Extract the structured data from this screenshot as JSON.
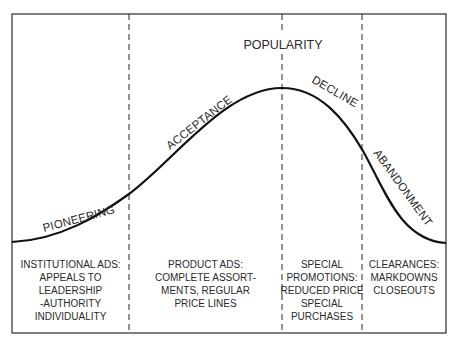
{
  "title": "POPULARITY",
  "stages": [
    {
      "name": "PIONEERING",
      "strategy_lines": [
        "INSTITUTIONAL ADS:",
        "APPEALS TO",
        "LEADERSHIP",
        "-AUTHORITY",
        "INDIVIDUALITY"
      ]
    },
    {
      "name": "ACCEPTANCE",
      "strategy_lines": [
        "PRODUCT ADS:",
        "COMPLETE ASSORT-",
        "MENTS, REGULAR",
        "PRICE LINES"
      ]
    },
    {
      "name": "DECLINE",
      "strategy_lines": [
        "SPECIAL",
        "PROMOTIONS:",
        "REDUCED PRICE",
        "SPECIAL",
        "PURCHASES"
      ]
    },
    {
      "name": "ABANDONMENT",
      "strategy_lines": [
        "CLEARANCES:",
        "MARKDOWNS",
        "CLOSEOUTS"
      ]
    }
  ]
}
